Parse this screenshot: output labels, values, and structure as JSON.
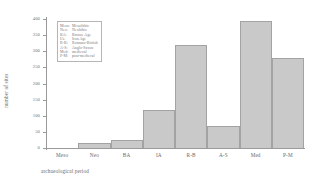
{
  "chart_data": {
    "type": "bar",
    "title": "",
    "xlabel": "archaeological period",
    "ylabel": "number of sites",
    "categories": [
      "Meso",
      "Neo",
      "BA",
      "IA",
      "R-B",
      "A-S",
      "Med",
      "P-M"
    ],
    "values": [
      0,
      15,
      25,
      118,
      320,
      68,
      395,
      278
    ],
    "ylim": [
      0,
      400
    ],
    "yticks": [
      0,
      50,
      100,
      150,
      200,
      250,
      300,
      350,
      400
    ],
    "ytick_labels": [
      "0",
      "50",
      "100",
      "150",
      "200",
      "250",
      "300",
      "350",
      "400"
    ],
    "grid": false,
    "legend_position": "inside-upper-left",
    "bar_fill_color": "#c9c9c9",
    "bar_edge_color": "#a3a3a3",
    "axis_color": "#9a9a9a",
    "text_color": "#6a6a6a",
    "background_color": "#ffffff"
  },
  "legend": {
    "entries": [
      {
        "abbr": "Meso",
        "full": "Mesolithic"
      },
      {
        "abbr": "Neo",
        "full": "Neolithic"
      },
      {
        "abbr": "BA",
        "full": "Bronze Age"
      },
      {
        "abbr": "IA",
        "full": "Iron Age"
      },
      {
        "abbr": "R-B",
        "full": "Romano-British"
      },
      {
        "abbr": "A-S",
        "full": "Anglo-Saxon"
      },
      {
        "abbr": "Med",
        "full": "medieval"
      },
      {
        "abbr": "P-M",
        "full": "post-medieval"
      }
    ]
  }
}
